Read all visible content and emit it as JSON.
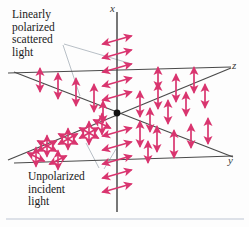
{
  "figure": {
    "background_color": "#fdfdfd",
    "arrow_color": "#d9356f",
    "axis_color": "#4a4a4a",
    "leader_color": "#9aa3ad",
    "origin_color": "#1a1a1a"
  },
  "axes": {
    "labels": [
      {
        "name": "x",
        "text": "x",
        "position": "top"
      },
      {
        "name": "z",
        "text": "z",
        "position": "upper-right"
      },
      {
        "name": "y",
        "text": "y",
        "position": "lower-right"
      }
    ],
    "origin": {
      "x": 117,
      "y": 113
    },
    "lines": [
      {
        "name": "x-axis",
        "x1": 117,
        "y1": 12,
        "x2": 117,
        "y2": 212
      },
      {
        "name": "z-axis",
        "x1": 8,
        "y1": 73,
        "x2": 231,
        "y2": 67
      },
      {
        "name": "y-axis",
        "x1": 14,
        "y1": 163,
        "x2": 233,
        "y2": 156
      }
    ]
  },
  "callouts": [
    {
      "name": "scattered-light-label",
      "text": "Linearly\npolarized\nscattered\nlight"
    },
    {
      "name": "incident-light-label",
      "text": "Unpolarized\nincident\nlight"
    }
  ],
  "arrow_groups": [
    {
      "name": "x-axis-upper-scattered",
      "description": "Double-headed arrows along the z direction, drawn up the x-axis",
      "orientation": "diagonal-z",
      "count": 8,
      "polarization": "linear"
    },
    {
      "name": "x-axis-lower-scattered",
      "description": "Double-headed arrows along the z direction, drawn down the x-axis",
      "orientation": "diagonal-z",
      "count": 8,
      "polarization": "linear"
    },
    {
      "name": "z-axis-positive-scattered",
      "description": "Vertical double-headed arrows along the positive z-axis",
      "orientation": "vertical",
      "count": 9,
      "polarization": "linear"
    },
    {
      "name": "z-axis-negative-scattered",
      "description": "Vertical double-headed arrows along the negative z-axis",
      "orientation": "vertical",
      "count": 5,
      "polarization": "linear"
    },
    {
      "name": "y-axis-positive-scattered",
      "description": "Vertical double-headed arrows along the positive y-axis",
      "orientation": "vertical",
      "count": 6,
      "polarization": "linear"
    },
    {
      "name": "y-axis-incident-unpolarized",
      "description": "Star clusters of crossed double-headed arrows on the incoming beam",
      "orientation": "multi",
      "count": 6,
      "polarization": "unpolarized"
    }
  ]
}
